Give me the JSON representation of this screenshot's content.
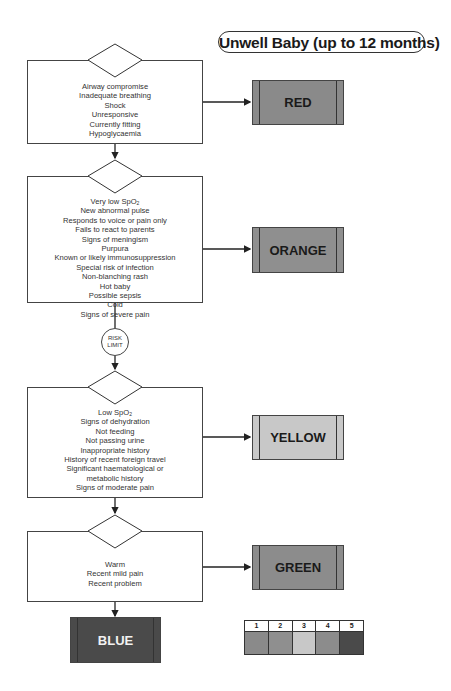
{
  "title": "Unwell Baby (up to 12 months)",
  "colors": {
    "red": "#8a8a8a",
    "orange": "#8f8f8f",
    "yellow": "#c8c8c8",
    "green": "#8c8c8c",
    "blue": "#4a4a4a",
    "line": "#222222"
  },
  "steps": [
    {
      "id": "red",
      "criteria": [
        "Airway compromise",
        "Inadequate breathing",
        "Shock",
        "Unresponsive",
        "Currently fitting",
        "Hypoglycaemia"
      ],
      "category_label": "RED"
    },
    {
      "id": "orange",
      "criteria_first": {
        "text": "Very low SpO",
        "sub": "2"
      },
      "criteria": [
        "New abnormal pulse",
        "Responds to voice or pain only",
        "Fails to react to parents",
        "Signs of meningism",
        "Purpura",
        "Known or likely immunosuppression",
        "Special risk of infection",
        "Non-blanching rash",
        "Hot baby",
        "Possible sepsis",
        "Cold",
        "Signs of severe pain"
      ],
      "category_label": "ORANGE"
    },
    {
      "id": "yellow",
      "criteria_first": {
        "text": "Low SpO",
        "sub": "2"
      },
      "criteria": [
        "Signs of dehydration",
        "Not feeding",
        "Not passing urine",
        "Inappropriate history",
        "History of recent foreign travel",
        "Significant haematological or",
        "metabolic history",
        "Signs of moderate pain"
      ],
      "category_label": "YELLOW"
    },
    {
      "id": "green",
      "criteria": [
        "Warm",
        "Recent mild pain",
        "Recent problem"
      ],
      "category_label": "GREEN"
    }
  ],
  "risk_limit": {
    "line1": "RISK",
    "line2": "LIMIT"
  },
  "final_category": "BLUE",
  "legend": {
    "numbers": [
      "1",
      "2",
      "3",
      "4",
      "5"
    ],
    "swatch_colors": [
      "#8a8a8a",
      "#8f8f8f",
      "#c8c8c8",
      "#8c8c8c",
      "#4a4a4a"
    ]
  }
}
